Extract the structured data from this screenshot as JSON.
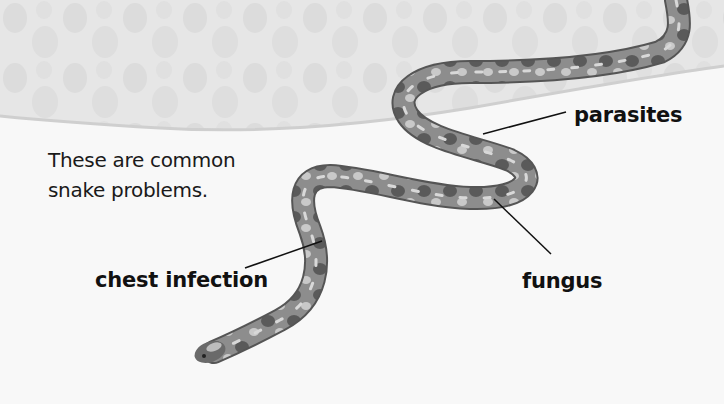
{
  "page": {
    "intro_line1": "These are common",
    "intro_line2": "snake problems."
  },
  "labels": {
    "parasites": "parasites",
    "fungus": "fungus",
    "chest_infection": "chest infection"
  },
  "image": {
    "subject": "snake",
    "style": "grayscale photo"
  },
  "colors": {
    "background": "#f8f8f8",
    "header_band": "#e4e4e4",
    "text": "#111111",
    "leader_line": "#111111"
  }
}
